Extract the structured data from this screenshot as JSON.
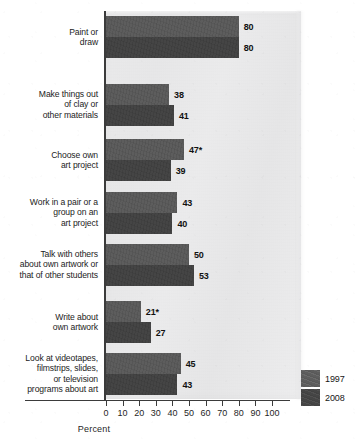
{
  "chart_data": {
    "type": "bar",
    "orientation": "horizontal",
    "title": "",
    "xlabel": "Percent",
    "ylabel": "",
    "xlim": [
      0,
      100
    ],
    "grid": false,
    "legend_position": "bottom-right",
    "x_ticks": [
      "0",
      "10",
      "20",
      "30",
      "40",
      "50",
      "60",
      "70",
      "80",
      "90",
      "100"
    ],
    "x_tick_values": [
      0,
      10,
      20,
      30,
      40,
      50,
      60,
      70,
      80,
      90,
      100
    ],
    "categories": [
      "Paint or\ndraw",
      "Make things out\nof clay or\nother materials",
      "Choose own\nart project",
      "Work in a pair or a\ngroup on an\nart project",
      "Talk with others\nabout own artwork or\nthat of other students",
      "Write about\nown artwork",
      "Look at videotapes,\nfilmstrips, slides,\nor television\nprograms about art"
    ],
    "series": [
      {
        "name": "1997",
        "color": "#5d5d5d",
        "values": [
          80,
          38,
          47,
          43,
          50,
          21,
          45
        ],
        "labels": [
          "80",
          "38",
          "47*",
          "43",
          "50",
          "21*",
          "45"
        ]
      },
      {
        "name": "2008",
        "color": "#454545",
        "values": [
          80,
          41,
          39,
          40,
          53,
          27,
          43
        ],
        "labels": [
          "80",
          "41",
          "39",
          "40",
          "53",
          "27",
          "43"
        ]
      }
    ],
    "annotations": [
      "* indicates significantly different from 2008"
    ]
  },
  "legend": {
    "items": [
      {
        "label": "1997",
        "color": "#5d5d5d"
      },
      {
        "label": "2008",
        "color": "#454545"
      }
    ]
  },
  "axis": {
    "x_title": "Percent"
  },
  "category_labels": [
    {
      "lines": [
        "Paint or",
        "draw"
      ]
    },
    {
      "lines": [
        "Make things out",
        "of clay or",
        "other materials"
      ]
    },
    {
      "lines": [
        "Choose own",
        "art project"
      ]
    },
    {
      "lines": [
        "Work in a pair or a",
        "group on an",
        "art project"
      ]
    },
    {
      "lines": [
        "Talk with others",
        "about own artwork or",
        "that of other students"
      ]
    },
    {
      "lines": [
        "Write about",
        "own artwork"
      ]
    },
    {
      "lines": [
        "Look at videotapes,",
        "filmstrips, slides,",
        "or television",
        "programs about art"
      ]
    }
  ]
}
